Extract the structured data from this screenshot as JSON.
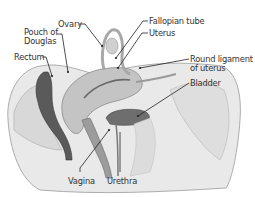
{
  "diagram": {
    "labels": [
      {
        "id": "ovary",
        "text": "Ovary"
      },
      {
        "id": "pouch",
        "text": "Pouch of",
        "text2": "Douglas"
      },
      {
        "id": "rectum",
        "text": "Rectum"
      },
      {
        "id": "fallopian",
        "text": "Fallopian tube"
      },
      {
        "id": "uterus",
        "text": "Uterus"
      },
      {
        "id": "round",
        "text": "Round ligament",
        "text2": "of uterus"
      },
      {
        "id": "bladder",
        "text": "Bladder"
      },
      {
        "id": "vagina",
        "text": "Vagina"
      },
      {
        "id": "urethra",
        "text": "Urethra"
      }
    ],
    "colors": {
      "tissue_light": "#d4d4d4",
      "tissue_mid": "#a8a8a8",
      "tissue_dark": "#555555",
      "leader_line": "#222222",
      "label_text": "#333333"
    }
  }
}
